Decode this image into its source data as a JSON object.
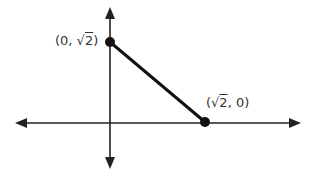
{
  "diagram": {
    "type": "coordinate-plane-segment",
    "axes": {
      "color": "#222222"
    },
    "segment": {
      "color": "#111111"
    },
    "points": [
      {
        "id": "A",
        "label_prefix": "(0, √",
        "label_rad": "2",
        "label_suffix": ")",
        "label": "(0, √2)"
      },
      {
        "id": "B",
        "label_prefix": "(√",
        "label_rad": "2",
        "label_suffix": ", 0)",
        "label": "(√2, 0)"
      }
    ]
  }
}
